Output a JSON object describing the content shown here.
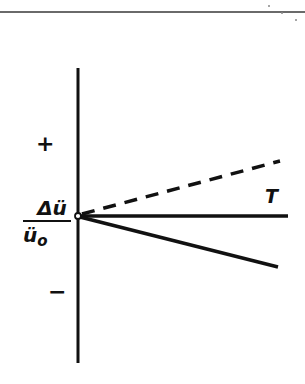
{
  "figure": {
    "top_rule": true,
    "axis": {
      "orientation": "vertical",
      "x": 78,
      "y_top": 68,
      "y_bottom": 363,
      "origin": {
        "x": 78,
        "y": 216
      },
      "positive_label": "+",
      "negative_label": "−",
      "quantity": {
        "numerator": "Δü",
        "denominator_base": "ü",
        "denominator_subscript": "o"
      }
    },
    "curves": [
      {
        "id": "dashed-rising",
        "style": "dashed",
        "from": [
          78,
          216
        ],
        "to": [
          280,
          161
        ],
        "label": "T",
        "direction": "positive"
      },
      {
        "id": "solid-horizontal",
        "style": "solid",
        "from": [
          78,
          216
        ],
        "to": [
          288,
          216
        ],
        "label": "",
        "direction": "zero"
      },
      {
        "id": "solid-falling",
        "style": "solid",
        "from": [
          78,
          216
        ],
        "to": [
          278,
          267
        ],
        "label": "",
        "direction": "negative"
      }
    ],
    "colors": {
      "ink": "#111111",
      "rule": "#6a6a6a",
      "background": "#ffffff"
    }
  }
}
